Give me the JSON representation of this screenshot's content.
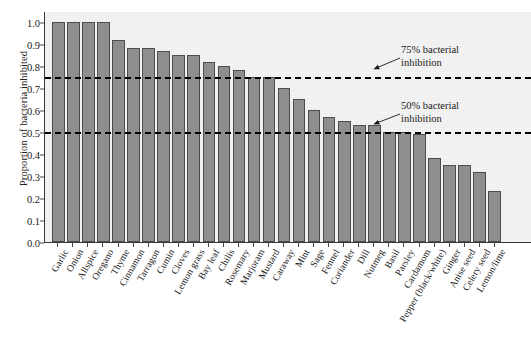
{
  "chart_data": {
    "type": "bar",
    "title": "",
    "xlabel": "",
    "ylabel": "Proportion of bacteria inhibited",
    "ylim": [
      0.0,
      1.05
    ],
    "grid": false,
    "legend": null,
    "ytick_labels": [
      "0.0",
      "0.1",
      "0.2",
      "0.3",
      "0.4",
      "0.5",
      "0.6",
      "0.7",
      "0.8",
      "0.9",
      "1.0"
    ],
    "ytick_values": [
      0.0,
      0.1,
      0.2,
      0.3,
      0.4,
      0.5,
      0.6,
      0.7,
      0.8,
      0.9,
      1.0
    ],
    "categories": [
      "Garlic",
      "Onion",
      "Allspice",
      "Oregano",
      "Thyme",
      "Cinnamon",
      "Tarragon",
      "Cumin",
      "Cloves",
      "Lemon grass",
      "Bay leaf",
      "Chilis",
      "Rosemary",
      "Marjoram",
      "Mustard",
      "Caraway",
      "Mint",
      "Sage",
      "Fennel",
      "Coriander",
      "Dill",
      "Nutmeg",
      "Basil",
      "Parsley",
      "Cardamom",
      "Pepper (black/white)",
      "Ginger",
      "Anise seed",
      "Celery seed",
      "Lemon/lime"
    ],
    "values": [
      1.0,
      1.0,
      1.0,
      1.0,
      0.92,
      0.88,
      0.88,
      0.87,
      0.85,
      0.85,
      0.82,
      0.8,
      0.78,
      0.75,
      0.75,
      0.7,
      0.65,
      0.6,
      0.57,
      0.55,
      0.53,
      0.53,
      0.5,
      0.5,
      0.49,
      0.38,
      0.35,
      0.35,
      0.32,
      0.23
    ],
    "annotations": [
      {
        "text_line1": "75% bacterial",
        "text_line2": "inhibition",
        "y_value": 0.75
      },
      {
        "text_line1": "50% bacterial",
        "text_line2": "inhibition",
        "y_value": 0.5
      }
    ],
    "threshold_lines": [
      0.75,
      0.5
    ],
    "colors": {
      "bar_fill": "#8e8e8e",
      "bar_edge": "#4d4d4d",
      "plot_background": "#f1f1f1",
      "threshold": "#000000",
      "text": "#1a1a1a",
      "axis": "#3a3a3a"
    }
  }
}
